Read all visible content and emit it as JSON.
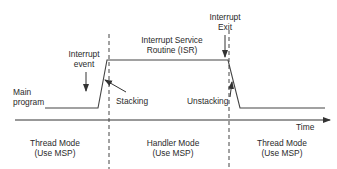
{
  "labels": {
    "interrupt_event": [
      "Interrupt",
      "event"
    ],
    "isr": [
      "Interrupt Service",
      "Routine (ISR)"
    ],
    "interrupt_exit": [
      "Interrupt",
      "Exit"
    ],
    "main_program": [
      "Main",
      "program"
    ],
    "stacking": "Stacking",
    "unstacking": "Unstacking",
    "time": "Time"
  },
  "modes": [
    {
      "name": "Thread Mode",
      "stack": "(Use MSP)"
    },
    {
      "name": "Handler Mode",
      "stack": "(Use MSP)"
    },
    {
      "name": "Thread Mode",
      "stack": "(Use MSP)"
    }
  ],
  "colors": {
    "line": "#333333",
    "text": "#2a2a2a",
    "background": "#ffffff"
  }
}
